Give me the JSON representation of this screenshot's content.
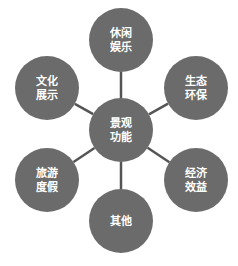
{
  "diagram": {
    "type": "radial",
    "colors": {
      "node_fill": "#6b6b6b",
      "connector": "#555555",
      "text": "#ffffff",
      "background": "#ffffff"
    },
    "center": {
      "id": "center",
      "lines": [
        "景观",
        "功能"
      ]
    },
    "nodes": [
      {
        "id": "top",
        "lines": [
          "休闲",
          "娱乐"
        ]
      },
      {
        "id": "top-right",
        "lines": [
          "生态",
          "环保"
        ]
      },
      {
        "id": "bottom-right",
        "lines": [
          "经济",
          "效益"
        ]
      },
      {
        "id": "bottom",
        "lines": [
          "其他"
        ]
      },
      {
        "id": "bottom-left",
        "lines": [
          "旅游",
          "度假"
        ]
      },
      {
        "id": "top-left",
        "lines": [
          "文化",
          "展示"
        ]
      }
    ]
  }
}
